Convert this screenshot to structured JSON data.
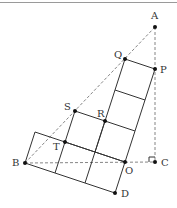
{
  "figure": {
    "points": {
      "A": {
        "label": "A",
        "x": 155,
        "y": 27
      },
      "P": {
        "label": "P",
        "x": 155,
        "y": 69
      },
      "Q": {
        "label": "Q",
        "x": 125,
        "y": 59
      },
      "S": {
        "label": "S",
        "x": 75,
        "y": 111
      },
      "R": {
        "label": "R",
        "x": 105,
        "y": 121
      },
      "T": {
        "label": "T",
        "x": 65,
        "y": 142
      },
      "B": {
        "label": "B",
        "x": 25,
        "y": 163
      },
      "O": {
        "label": "O",
        "x": 125,
        "y": 162
      },
      "C": {
        "label": "C",
        "x": 155,
        "y": 162
      },
      "D": {
        "label": "D",
        "x": 115,
        "y": 193
      }
    },
    "right_angle_at": "C"
  }
}
